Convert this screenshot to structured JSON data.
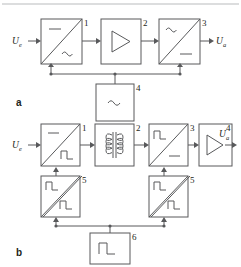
{
  "figure": {
    "top_rule": true,
    "stroke_color": "#58595b",
    "text_color": "#231f20",
    "background": "#ffffff"
  },
  "panels": [
    {
      "id": "a",
      "label": "a",
      "description": "DC to AC inverter, amplifier, AC to DC rectifier driven by an oscillator",
      "input_port": {
        "symbol": "U",
        "subscript": "e"
      },
      "output_port": {
        "symbol": "U",
        "subscript": "a"
      },
      "blocks": [
        {
          "number": "1",
          "name": "inverter-dc-ac",
          "kind": "converter",
          "top_left_symbol": "dc",
          "bottom_right_symbol": "ac",
          "top_left_glyph": "—",
          "bottom_right_glyph": "~"
        },
        {
          "number": "2",
          "name": "amplifier",
          "kind": "amplifier",
          "symbol": "triangle"
        },
        {
          "number": "3",
          "name": "rectifier-ac-dc",
          "kind": "converter",
          "top_left_symbol": "ac",
          "bottom_right_symbol": "dc",
          "top_left_glyph": "~",
          "bottom_right_glyph": "—"
        },
        {
          "number": "4",
          "name": "oscillator",
          "kind": "source",
          "symbol": "ac",
          "glyph": "~"
        }
      ],
      "control_bus": {
        "from": "4",
        "to": [
          "1",
          "3"
        ]
      }
    },
    {
      "id": "b",
      "label": "b",
      "description": "DC to pulse inverter, transformer, pulse to DC rectifier, amplifier, with two drivers and a clock generator",
      "input_port": {
        "symbol": "U",
        "subscript": "e"
      },
      "output_port": {
        "symbol": "U",
        "subscript": "a"
      },
      "blocks": [
        {
          "number": "1",
          "name": "inverter-dc-pulse",
          "kind": "converter",
          "top_left_symbol": "dc",
          "bottom_right_symbol": "pulse",
          "top_left_glyph": "—",
          "bottom_right_glyph": "⊓"
        },
        {
          "number": "2",
          "name": "transformer",
          "kind": "transformer",
          "symbol": "coupled-coils"
        },
        {
          "number": "3",
          "name": "rectifier-pulse-dc",
          "kind": "converter",
          "top_left_symbol": "pulse",
          "bottom_right_symbol": "dc",
          "top_left_glyph": "⊓",
          "bottom_right_glyph": "—"
        },
        {
          "number": "4",
          "name": "amplifier",
          "kind": "amplifier",
          "symbol": "triangle"
        },
        {
          "number": "5",
          "name": "driver-left",
          "kind": "driver",
          "top_left_symbol": "pulse",
          "bottom_right_symbol": "pulse",
          "top_left_glyph": "⊓",
          "bottom_right_glyph": "⊓"
        },
        {
          "number": "5",
          "name": "driver-right",
          "kind": "driver",
          "top_left_symbol": "pulse",
          "bottom_right_symbol": "pulse",
          "top_left_glyph": "⊓",
          "bottom_right_glyph": "⊓"
        },
        {
          "number": "6",
          "name": "clock-generator",
          "kind": "source",
          "symbol": "pulse",
          "glyph": "⊓"
        }
      ],
      "control_bus": {
        "from": "6",
        "to": [
          "5-left",
          "5-right"
        ]
      }
    }
  ]
}
